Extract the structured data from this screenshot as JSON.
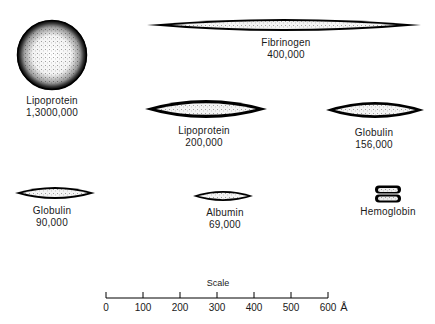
{
  "molecules": [
    {
      "name": "Lipoprotein",
      "weight": "1,3000,000",
      "shape": "sphere",
      "cx": 52,
      "cy": 55,
      "rx": 35,
      "ry": 35,
      "label_x": 52,
      "label_y": 95
    },
    {
      "name": "Fibrinogen",
      "weight": "400,000",
      "shape": "ellipse",
      "cx": 284,
      "cy": 25,
      "rx": 137,
      "ry": 6,
      "label_x": 286,
      "label_y": 37
    },
    {
      "name": "Lipoprotein",
      "weight": "200,000",
      "shape": "ellipse",
      "cx": 206,
      "cy": 109,
      "rx": 61,
      "ry": 9,
      "label_x": 204,
      "label_y": 125
    },
    {
      "name": "Globulin",
      "weight": "156,000",
      "shape": "ellipse",
      "cx": 375,
      "cy": 110,
      "rx": 49,
      "ry": 8,
      "label_x": 374,
      "label_y": 127
    },
    {
      "name": "Globulin",
      "weight": "90,000",
      "shape": "ellipse",
      "cx": 55,
      "cy": 193,
      "rx": 40,
      "ry": 6,
      "label_x": 52,
      "label_y": 205
    },
    {
      "name": "Albumin",
      "weight": "69,000",
      "shape": "ellipse",
      "cx": 223,
      "cy": 196,
      "rx": 30,
      "ry": 5,
      "label_x": 225,
      "label_y": 207
    },
    {
      "name": "Hemoglobin",
      "weight": "",
      "shape": "stacked",
      "cx": 388,
      "cy": 194,
      "rx": 13,
      "ry": 8,
      "label_x": 388,
      "label_y": 206
    }
  ],
  "scale": {
    "title": "Scale",
    "unit": "Å",
    "ticks": [
      "0",
      "100",
      "200",
      "300",
      "400",
      "500",
      "600"
    ],
    "x_start": 106,
    "x_end": 328,
    "y": 298
  }
}
